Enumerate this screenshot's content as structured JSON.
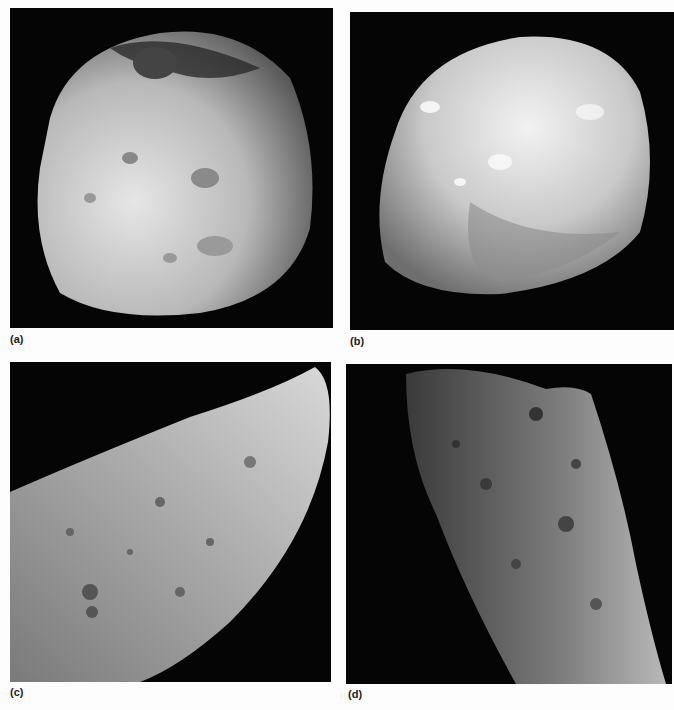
{
  "figure": {
    "panels": [
      {
        "id": "a",
        "label": "(a)",
        "subject": "irregular cratered moon, lit from left, large crater near top"
      },
      {
        "id": "b",
        "label": "(b)",
        "subject": "smooth rounded irregular body with bright patches"
      },
      {
        "id": "c",
        "label": "(c)",
        "subject": "close-up of elongated cratered asteroid surface, diagonal limb"
      },
      {
        "id": "d",
        "label": "(d)",
        "subject": "close-up of heavily cratered elongated body, vertical orientation"
      }
    ]
  }
}
